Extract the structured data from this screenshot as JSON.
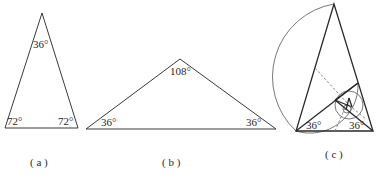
{
  "figures": [
    {
      "id": "a",
      "caption": "( a )",
      "type": "isosceles-triangle",
      "angles": {
        "apex": "36°",
        "base_left": "72°",
        "base_right": "72°"
      }
    },
    {
      "id": "b",
      "caption": "( b )",
      "type": "isosceles-triangle",
      "angles": {
        "apex": "108°",
        "base_left": "36°",
        "base_right": "36°"
      }
    },
    {
      "id": "c",
      "caption": "( c )",
      "type": "golden-triangle-spiral-construction",
      "angles": {
        "base_left": "36°",
        "base_right": "36°"
      }
    }
  ],
  "colors": {
    "stroke": "#3a3a3a",
    "circle": "#6a6a6a",
    "dashed": "#777777",
    "background": "#ffffff"
  }
}
